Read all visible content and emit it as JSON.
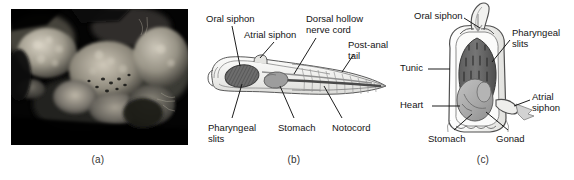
{
  "figure": {
    "type": "three-panel-biology-figure",
    "background_color": "#ffffff",
    "text_color": "#141414"
  },
  "panels": [
    {
      "id": "a",
      "caption": "(a)",
      "kind": "photograph",
      "description": "Dark underwater photograph of a tunicate (sea squirt) colony with pale lumpy bodies and visible siphon openings against a black background",
      "frame": {
        "x": 11,
        "y": 9,
        "width": 177,
        "height": 136
      },
      "palette": {
        "background": "#050505",
        "organism_light": "#cfc9bd",
        "organism_mid": "#8d8madjust",
        "organism_dark": "#2a2a28"
      }
    },
    {
      "id": "b",
      "caption": "(b)",
      "kind": "diagram",
      "title": "Tunicate larva",
      "labels": [
        {
          "name": "oral-siphon",
          "text": "Oral siphon",
          "x": 10,
          "y": 14,
          "align": "left"
        },
        {
          "name": "atrial-siphon",
          "text": "Atrial siphon",
          "x": 48,
          "y": 30,
          "align": "left"
        },
        {
          "name": "dorsal-hollow-nerve-cord",
          "text": "Dorsal hollow\nnerve cord",
          "x": 110,
          "y": 14,
          "align": "left"
        },
        {
          "name": "post-anal-tail",
          "text": "Post-anal\ntail",
          "x": 152,
          "y": 40,
          "align": "left"
        },
        {
          "name": "pharyngeal-slits",
          "text": "Pharyngeal\nslits",
          "x": 12,
          "y": 123,
          "align": "left"
        },
        {
          "name": "stomach",
          "text": "Stomach",
          "x": 82,
          "y": 123,
          "align": "left"
        },
        {
          "name": "notocord",
          "text": "Notocord",
          "x": 136,
          "y": 123,
          "align": "left"
        }
      ],
      "palette": {
        "body_outline": "#4a4a4a",
        "body_fill": "#f2f2f0",
        "pharynx": "#6f6f6f",
        "stomach": "#9a9a9a",
        "notocord": "#555555",
        "tail_fill": "#dcdcdc"
      }
    },
    {
      "id": "c",
      "caption": "(c)",
      "kind": "diagram",
      "title": "Adult tunicate",
      "labels": [
        {
          "name": "oral-siphon",
          "text": "Oral siphon",
          "x": 22,
          "y": 11,
          "align": "left"
        },
        {
          "name": "pharyngeal-slits",
          "text": "Pharyngeal\nslits",
          "x": 120,
          "y": 28,
          "align": "left"
        },
        {
          "name": "tunic",
          "text": "Tunic",
          "x": 8,
          "y": 63,
          "align": "left"
        },
        {
          "name": "atrial-siphon",
          "text": "Atrial\nsiphon",
          "x": 140,
          "y": 92,
          "align": "left"
        },
        {
          "name": "heart",
          "text": "Heart",
          "x": 8,
          "y": 100,
          "align": "left"
        },
        {
          "name": "stomach",
          "text": "Stomach",
          "x": 36,
          "y": 134,
          "align": "left"
        },
        {
          "name": "gonad",
          "text": "Gonad",
          "x": 104,
          "y": 134,
          "align": "left"
        }
      ],
      "palette": {
        "tunic_outline": "#4a4a4a",
        "tunic_fill": "#f4f4f2",
        "pharynx_dark": "#6b6b6b",
        "gonad": "#a9a9a9",
        "stomach": "#8f8f8f",
        "siphon_arrow": "#c9c9c9"
      }
    }
  ]
}
